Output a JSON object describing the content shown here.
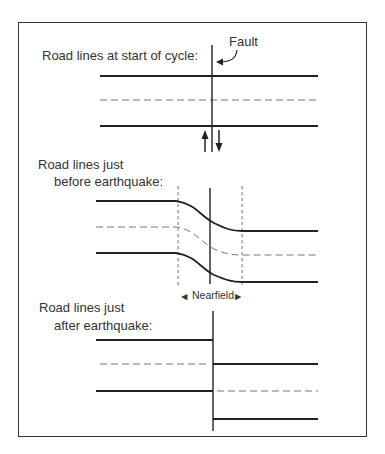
{
  "diagram": {
    "panels": [
      {
        "label_line1": "Road lines at start of cycle:",
        "label_line2": ""
      },
      {
        "label_line1": "Road lines just",
        "label_line2": "before earthquake:"
      },
      {
        "label_line1": "Road lines just",
        "label_line2": "after earthquake:"
      }
    ],
    "fault_label": "Fault",
    "nearfield_label": "Nearfield",
    "nearfield_left_arrow": "◄",
    "nearfield_right_arrow": "►",
    "colors": {
      "line": "#222222",
      "dashed": "#777777",
      "text": "#333333"
    }
  }
}
